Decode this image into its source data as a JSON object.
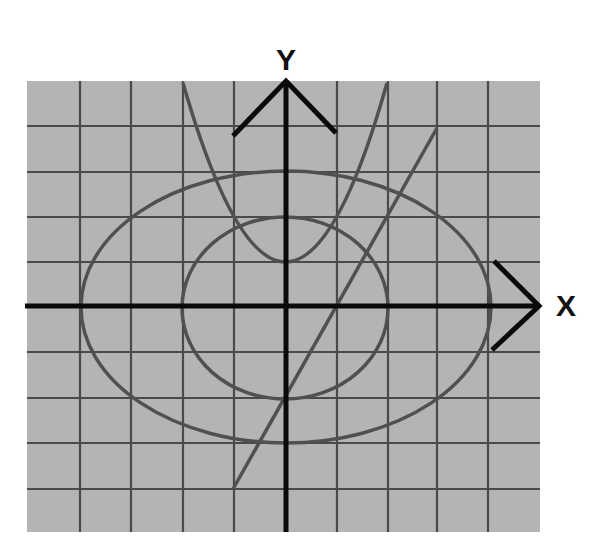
{
  "diagram": {
    "title": "",
    "axes": {
      "x_label": "X",
      "y_label": "Y"
    },
    "grid": {
      "columns": 10,
      "rows": 10,
      "background_color": "#b4b4b4",
      "line_color": "#4a4a4a"
    },
    "colors": {
      "axis": "#0a0a0a",
      "curve": "#505050"
    },
    "curves": [
      {
        "name": "parabola",
        "type": "parabola",
        "description": "upward-opening parabola with vertex on the y-axis above the origin"
      },
      {
        "name": "large-ellipse",
        "type": "ellipse",
        "description": "large ellipse centered at origin, wider than tall"
      },
      {
        "name": "small-ellipse",
        "type": "ellipse",
        "description": "small ellipse centered at origin"
      },
      {
        "name": "straight-line",
        "type": "line",
        "description": "line with positive slope crossing x-axis right of origin"
      }
    ]
  }
}
